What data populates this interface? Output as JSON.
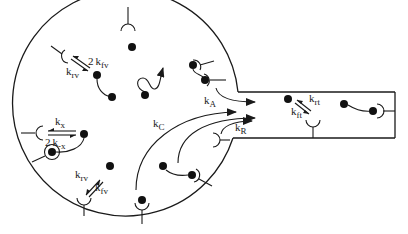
{
  "diagram": {
    "colors": {
      "ink": "#1a1a1a",
      "background": "#ffffff"
    },
    "labels": {
      "kfv_top_2": "2",
      "kfv_top_k": "k",
      "kfv_top_sub": "fv",
      "krv_top_k": "k",
      "krv_top_sub": "rv",
      "kx_k": "k",
      "kx_sub": "x",
      "kmx_2": "2",
      "kmx_k": "k",
      "kmx_sub": "-x",
      "krv_bot_k": "k",
      "krv_bot_sub": "rv",
      "kfv_bot_k": "k",
      "kfv_bot_sub": "fv",
      "kA_k": "k",
      "kA_sub": "A",
      "kC_k": "k",
      "kC_sub": "C",
      "kR_k": "k",
      "kR_sub": "R",
      "krt_k": "k",
      "krt_sub": "rt",
      "kft_k": "k",
      "kft_sub": "ft"
    },
    "legend_rates": [
      "2 k_fv",
      "k_rv",
      "k_x",
      "2 k_-x",
      "k_A",
      "k_C",
      "k_R",
      "k_rt",
      "k_ft"
    ]
  }
}
